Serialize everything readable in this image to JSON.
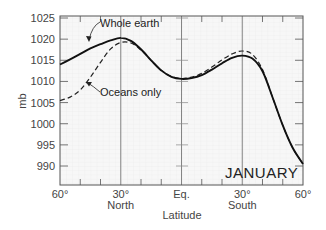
{
  "chart_data": {
    "type": "line",
    "title": "",
    "xlabel": "Latitude",
    "ylabel": "mb",
    "ylim": [
      986,
      1025
    ],
    "xlim": [
      60,
      -60
    ],
    "grid": true,
    "annotation": "JANUARY",
    "x_ticks": [
      {
        "lat": 60,
        "label": "60°",
        "sub": ""
      },
      {
        "lat": 30,
        "label": "30°",
        "sub": "North"
      },
      {
        "lat": 0,
        "label": "Eq.",
        "sub": ""
      },
      {
        "lat": -30,
        "label": "30°",
        "sub": "South"
      },
      {
        "lat": -60,
        "label": "60°",
        "sub": ""
      }
    ],
    "y_ticks": [
      1025,
      1020,
      1015,
      1010,
      1005,
      1000,
      995,
      990
    ],
    "x": [
      60,
      55,
      50,
      45,
      40,
      35,
      30,
      25,
      20,
      15,
      10,
      5,
      0,
      -5,
      -10,
      -15,
      -20,
      -25,
      -30,
      -35,
      -40,
      -45,
      -50,
      -55,
      -60
    ],
    "series": [
      {
        "name": "Whole earth",
        "style": "solid",
        "values": [
          1014.0,
          1015.2,
          1016.5,
          1017.8,
          1018.8,
          1019.7,
          1020.3,
          1019.6,
          1017.6,
          1015.0,
          1012.6,
          1011.1,
          1010.6,
          1010.8,
          1011.5,
          1012.8,
          1014.3,
          1015.6,
          1016.1,
          1015.4,
          1012.4,
          1006.2,
          999.6,
          994.2,
          990.5
        ]
      },
      {
        "name": "Oceans only",
        "style": "dashed",
        "values": [
          1005.5,
          1006.3,
          1008.0,
          1011.0,
          1014.5,
          1017.7,
          1019.2,
          1019.1,
          1017.4,
          1015.0,
          1012.6,
          1011.2,
          1010.7,
          1011.0,
          1011.9,
          1013.4,
          1015.1,
          1016.5,
          1017.2,
          1016.4,
          1012.8,
          1006.2,
          999.6,
          994.2,
          990.5
        ]
      }
    ],
    "labels": {
      "whole_earth": "Whole earth",
      "oceans_only": "Oceans only"
    }
  }
}
